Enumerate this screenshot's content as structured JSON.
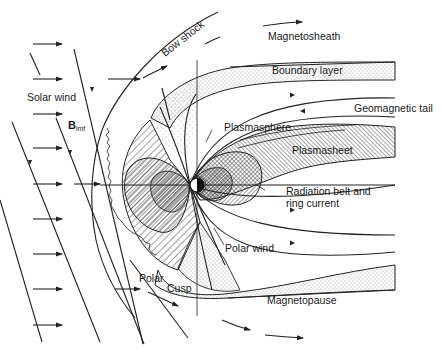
{
  "diagram": {
    "type": "magnetosphere-schematic",
    "labels": {
      "bow_shock": "Bow shock",
      "magnetosheath": "Magnetosheath",
      "boundary_layer": "Boundary layer",
      "geomagnetic_tail": "Geomagnetic tail",
      "solar_wind": "Solar wind",
      "b_imf_main": "B",
      "b_imf_sub": "imf",
      "plasmasphere": "Plasmasphere",
      "plasmasheet": "Plasmasheet",
      "radiation_belt_line1": "Radiation belt and",
      "radiation_belt_line2": "ring current",
      "polar_wind": "Polar wind",
      "polar": "Polar",
      "cusp": "Cusp",
      "magnetopause": "Magnetopause"
    },
    "regions": [
      "Bow shock",
      "Magnetosheath",
      "Boundary layer",
      "Geomagnetic tail",
      "Plasmasphere",
      "Plasmasheet",
      "Radiation belt and ring current",
      "Polar wind",
      "Polar cusp",
      "Magnetopause"
    ],
    "colors": {
      "ink": "#1a1a1a",
      "background": "#ffffff"
    }
  }
}
